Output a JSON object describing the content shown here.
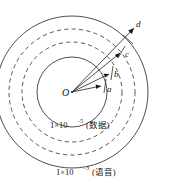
{
  "figure": {
    "center_label": "O",
    "background_color": "#ffffff",
    "line_color": "#3a3a3a",
    "text_color": "#141414"
  },
  "annotations": {
    "inner_ring_label": "1×10⁻⁵(数据)",
    "inner_ring_label_mantissa": "1×10",
    "inner_ring_label_exponent": "−5",
    "inner_ring_label_suffix": "(数据)",
    "outer_ring_label": "1×10⁻³(语音)",
    "outer_ring_label_mantissa": "1×10",
    "outer_ring_label_exponent": "−3",
    "outer_ring_label_suffix": "(语音)"
  },
  "rays": [
    {
      "id": "a",
      "label": "a",
      "length_rank": 1
    },
    {
      "id": "b",
      "label": "b",
      "length_rank": 2
    },
    {
      "id": "c",
      "label": "c",
      "length_rank": 3
    },
    {
      "id": "d",
      "label": "d",
      "length_rank": 4
    }
  ],
  "circles": [
    {
      "id": "outer-solid",
      "style": "solid",
      "radius_rank": 4
    },
    {
      "id": "outer-dashed",
      "style": "dashed",
      "radius_rank": 3
    },
    {
      "id": "inner-dashed",
      "style": "dashed",
      "radius_rank": 2
    },
    {
      "id": "inner-solid",
      "style": "solid",
      "radius_rank": 1
    }
  ]
}
